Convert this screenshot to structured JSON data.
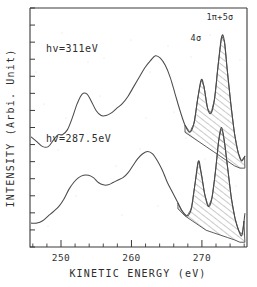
{
  "figure": {
    "kind": "photoemission-spectrum",
    "background": "#ffffff",
    "ink_color": "#4a4a4a"
  },
  "axes": {
    "x_title": "KINETIC ENERGY  (eV)",
    "y_title": "INTENSITY (Arbi. Unit)",
    "x_tick_labels": [
      "250",
      "260",
      "270"
    ],
    "x_tick_values": [
      250,
      260,
      270
    ],
    "x_minor_step": 2,
    "y_tick_count": 14,
    "y_tick_labels": []
  },
  "annotations": {
    "upper_curve_label": "hv=311eV",
    "lower_curve_label": "hv=287.5eV",
    "peak_4sigma": "4σ",
    "peak_1pi5sigma": "1π+5σ"
  },
  "chart_data": {
    "type": "line",
    "title": "",
    "subtitle": "",
    "xlabel": "KINETIC ENERGY  (eV)",
    "ylabel": "INTENSITY (Arbi. Unit)",
    "xlim": [
      245.6,
      276.4
    ],
    "ylim": [
      0,
      100
    ],
    "grid": false,
    "legend": "inline-annotation",
    "x_major_ticks": [
      250,
      260,
      270
    ],
    "x_minor_ticks": [
      246,
      248,
      252,
      254,
      256,
      258,
      262,
      264,
      266,
      268,
      272,
      274,
      276
    ],
    "y_ticks_labeled": false,
    "peak_annotations": [
      {
        "label": "4σ",
        "x": 270.0,
        "series": "both",
        "shaded": true
      },
      {
        "label": "1π+5σ",
        "x": 273.1,
        "series": "both",
        "shaded": true
      }
    ],
    "shaded_fill": "diagonal-hatch",
    "series": [
      {
        "name": "hv=311eV",
        "label_x": 250.0,
        "label_y": 84,
        "x": [
          245.8,
          246.6,
          247.4,
          248.2,
          249.0,
          249.6,
          250.2,
          250.9,
          251.6,
          252.3,
          253.0,
          253.7,
          254.3,
          255.0,
          255.7,
          256.4,
          257.1,
          257.9,
          258.7,
          259.5,
          260.3,
          261.1,
          261.9,
          262.7,
          263.4,
          264.1,
          264.8,
          265.5,
          266.2,
          266.9,
          267.6,
          268.3,
          268.9,
          269.4,
          269.9,
          270.3,
          270.8,
          271.3,
          271.8,
          272.3,
          272.8,
          273.2,
          273.6,
          274.1,
          274.6,
          275.1,
          275.6,
          276.1
        ],
        "y": [
          46,
          44,
          42,
          42,
          45,
          47,
          47,
          49,
          54,
          60,
          64,
          64,
          61,
          57,
          55,
          55,
          56,
          58,
          60,
          63,
          67,
          71,
          75,
          78,
          80,
          79,
          76,
          71,
          64,
          57,
          51,
          48,
          52,
          62,
          70,
          67,
          58,
          56,
          62,
          76,
          88,
          86,
          74,
          60,
          48,
          40,
          36,
          38
        ],
        "baseline_x": [
          267.6,
          268.6,
          269.6,
          270.6,
          271.6,
          272.6,
          273.6,
          274.6,
          275.4,
          276.1
        ],
        "baseline_y": [
          48,
          46,
          44,
          42,
          40,
          38,
          36,
          34,
          33,
          33
        ]
      },
      {
        "name": "hv=287.5eV",
        "label_x": 250.2,
        "label_y": 44,
        "x": [
          245.8,
          246.6,
          247.4,
          248.2,
          249.0,
          249.7,
          250.4,
          251.1,
          251.8,
          252.5,
          253.2,
          253.9,
          254.6,
          255.3,
          256.0,
          256.7,
          257.4,
          258.1,
          258.8,
          259.5,
          260.2,
          260.9,
          261.6,
          262.3,
          263.0,
          263.7,
          264.4,
          265.1,
          265.8,
          266.5,
          267.2,
          267.9,
          268.5,
          269.0,
          269.5,
          269.9,
          270.4,
          270.9,
          271.4,
          271.9,
          272.4,
          272.8,
          273.2,
          273.7,
          274.2,
          274.7,
          275.2,
          275.7,
          276.1
        ],
        "y": [
          10,
          10,
          11,
          13,
          15,
          17,
          20,
          24,
          27,
          29,
          30,
          30,
          29,
          27,
          26,
          26,
          27,
          28,
          29,
          31,
          34,
          37,
          39,
          40,
          39,
          36,
          32,
          27,
          23,
          19,
          15,
          13,
          16,
          26,
          36,
          31,
          22,
          17,
          20,
          31,
          45,
          50,
          44,
          32,
          20,
          12,
          7,
          5,
          14
        ],
        "baseline_x": [
          266.6,
          267.6,
          268.6,
          269.6,
          270.6,
          271.6,
          272.6,
          273.6,
          274.6,
          275.4,
          276.1
        ],
        "baseline_y": [
          16,
          13,
          11,
          9,
          7,
          6,
          5,
          4,
          3,
          2,
          2
        ]
      }
    ]
  }
}
